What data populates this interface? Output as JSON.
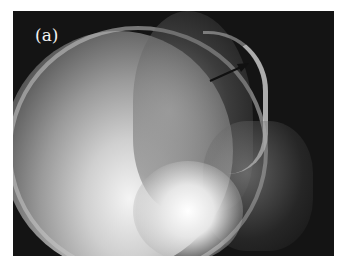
{
  "figure": {
    "label": "(a)",
    "annotation": "arrow-pointing-to-frontal-sinus",
    "colors": {
      "background": "#ffffff",
      "image_base": "#141414",
      "bone_highlight": "#f4f4f4",
      "arrow": "#111111"
    }
  }
}
